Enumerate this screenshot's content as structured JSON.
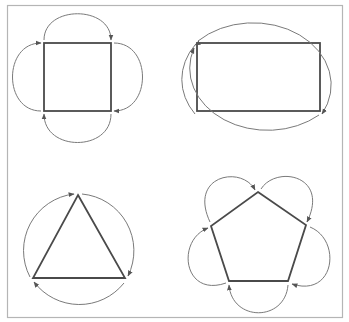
{
  "figure": {
    "colors": {
      "frame": "#b5b5b5",
      "shape_stroke": "#4a4a4a",
      "arc_stroke": "#7a7a7a",
      "arrowhead": "#555555",
      "background": "#ffffff"
    },
    "panels": [
      {
        "id": "square",
        "shape": "square",
        "vertices": [
          [
            44,
            43
          ],
          [
            111,
            43
          ],
          [
            111,
            111
          ],
          [
            44,
            111
          ]
        ],
        "arc_count": 4,
        "direction": "clockwise"
      },
      {
        "id": "rectangle",
        "shape": "rectangle",
        "vertices": [
          [
            197,
            43
          ],
          [
            320,
            43
          ],
          [
            320,
            111
          ],
          [
            197,
            111
          ]
        ],
        "enclosing": "ellipse",
        "ellipse": {
          "cx": 258,
          "cy": 78,
          "rx": 78,
          "ry": 62
        },
        "arc_count": 2,
        "direction": "clockwise"
      },
      {
        "id": "triangle",
        "shape": "triangle",
        "vertices": [
          [
            78,
            195
          ],
          [
            125,
            278
          ],
          [
            33,
            278
          ]
        ],
        "enclosing": "circle",
        "circle": {
          "cx": 79,
          "cy": 251,
          "r": 57
        },
        "arc_count": 3,
        "direction": "clockwise"
      },
      {
        "id": "pentagon",
        "shape": "pentagon",
        "vertices": [
          [
            258,
            192
          ],
          [
            306,
            225
          ],
          [
            288,
            281
          ],
          [
            229,
            281
          ],
          [
            211,
            226
          ]
        ],
        "arc_count": 5,
        "direction": "clockwise"
      }
    ]
  }
}
